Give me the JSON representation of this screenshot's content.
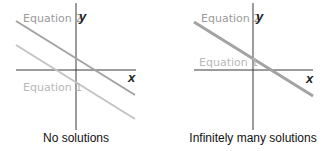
{
  "colors": {
    "axis": "#333333",
    "equation_2": "#a8a8a8",
    "equation_1": "#c8c8c8",
    "text_dark": "#111111"
  },
  "panels": [
    {
      "caption": "No solutions",
      "x_axis_label": "x",
      "y_axis_label": "y",
      "lines": [
        {
          "label": "Equation 2"
        },
        {
          "label": "Equation 1"
        }
      ]
    },
    {
      "caption": "Infinitely many solutions",
      "x_axis_label": "x",
      "y_axis_label": "y",
      "lines": [
        {
          "label": "Equation 2"
        },
        {
          "label": "Equation 1"
        }
      ]
    }
  ]
}
